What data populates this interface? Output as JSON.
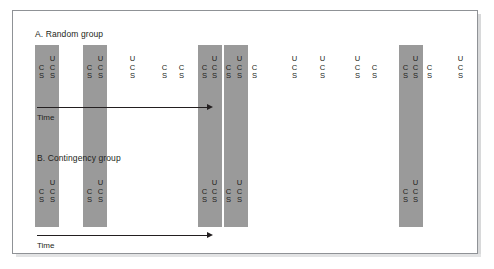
{
  "figure": {
    "type": "diagram",
    "colors": {
      "shade_bar": "#9a9a9a",
      "text": "#231f20",
      "frame_border": "#8f9296",
      "background": "#ffffff"
    }
  },
  "panels": [
    {
      "id": "panel-a",
      "title": "A. Random group",
      "time_label": "Time",
      "events": [
        {
          "id": "a-e1",
          "shaded": true,
          "cs_label": {
            "c": "C",
            "s": "S"
          },
          "us_label": {
            "u": "U",
            "c": "C",
            "s": "S"
          }
        },
        {
          "id": "a-e2",
          "shaded": true,
          "cs_label": {
            "c": "C",
            "s": "S"
          },
          "us_label": {
            "u": "U",
            "c": "C",
            "s": "S"
          }
        },
        {
          "id": "a-e3",
          "shaded": false,
          "cs_label": null,
          "us_label": {
            "u": "U",
            "c": "C",
            "s": "S"
          }
        },
        {
          "id": "a-e4",
          "shaded": false,
          "cs_label": {
            "c": "C",
            "s": "S"
          },
          "us_label": null
        },
        {
          "id": "a-e5",
          "shaded": false,
          "cs_label": {
            "c": "C",
            "s": "S"
          },
          "us_label": null
        },
        {
          "id": "a-e6",
          "shaded": true,
          "cs_label": {
            "c": "C",
            "s": "S"
          },
          "us_label": {
            "u": "U",
            "c": "C",
            "s": "S"
          }
        },
        {
          "id": "a-e7",
          "shaded": true,
          "cs_label": {
            "c": "C",
            "s": "S"
          },
          "us_label": {
            "u": "U",
            "c": "C",
            "s": "S"
          }
        },
        {
          "id": "a-e8",
          "shaded": false,
          "cs_label": {
            "c": "C",
            "s": "S"
          },
          "us_label": null
        },
        {
          "id": "a-e9",
          "shaded": false,
          "cs_label": null,
          "us_label": {
            "u": "U",
            "c": "C",
            "s": "S"
          }
        },
        {
          "id": "a-e10",
          "shaded": false,
          "cs_label": null,
          "us_label": {
            "u": "U",
            "c": "C",
            "s": "S"
          }
        },
        {
          "id": "a-e11",
          "shaded": false,
          "cs_label": null,
          "us_label": {
            "u": "U",
            "c": "C",
            "s": "S"
          }
        },
        {
          "id": "a-e12",
          "shaded": false,
          "cs_label": {
            "c": "C",
            "s": "S"
          },
          "us_label": null
        },
        {
          "id": "a-e13",
          "shaded": true,
          "cs_label": {
            "c": "C",
            "s": "S"
          },
          "us_label": {
            "u": "U",
            "c": "C",
            "s": "S"
          }
        },
        {
          "id": "a-e14",
          "shaded": false,
          "cs_label": {
            "c": "C",
            "s": "S"
          },
          "us_label": null
        },
        {
          "id": "a-e15",
          "shaded": false,
          "cs_label": null,
          "us_label": {
            "u": "U",
            "c": "C",
            "s": "S"
          }
        }
      ]
    },
    {
      "id": "panel-b",
      "title": "B. Contingency group",
      "time_label": "Time",
      "events": [
        {
          "id": "b-e1",
          "shaded": true,
          "cs_label": {
            "c": "C",
            "s": "S"
          },
          "us_label": {
            "u": "U",
            "c": "C",
            "s": "S"
          }
        },
        {
          "id": "b-e2",
          "shaded": true,
          "cs_label": {
            "c": "C",
            "s": "S"
          },
          "us_label": {
            "u": "U",
            "c": "C",
            "s": "S"
          }
        },
        {
          "id": "b-e3",
          "shaded": true,
          "cs_label": {
            "c": "C",
            "s": "S"
          },
          "us_label": {
            "u": "U",
            "c": "C",
            "s": "S"
          }
        },
        {
          "id": "b-e4",
          "shaded": true,
          "cs_label": {
            "c": "C",
            "s": "S"
          },
          "us_label": {
            "u": "U",
            "c": "C",
            "s": "S"
          }
        },
        {
          "id": "b-e5",
          "shaded": true,
          "cs_label": {
            "c": "C",
            "s": "S"
          },
          "us_label": {
            "u": "U",
            "c": "C",
            "s": "S"
          }
        }
      ]
    }
  ],
  "legend": {
    "cs_meaning": "CS",
    "us_meaning": "US"
  }
}
